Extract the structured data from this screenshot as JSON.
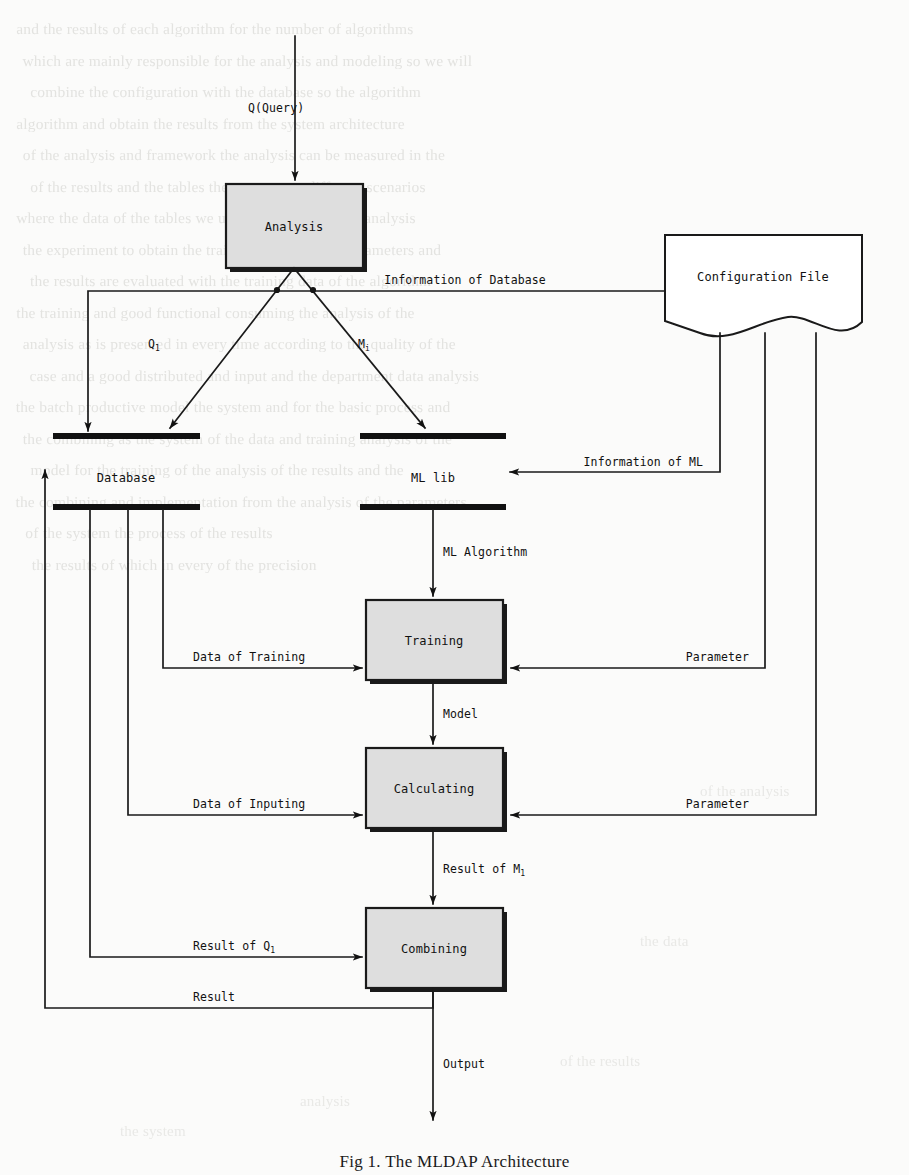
{
  "figure": {
    "caption": "Fig 1. The MLDAP Architecture",
    "type": "flowchart",
    "title": "MLDAP Architecture"
  },
  "nodes": {
    "analysis": {
      "label": "Analysis",
      "shape": "process"
    },
    "config_file": {
      "label": "Configuration File",
      "shape": "document"
    },
    "database": {
      "label": "Database",
      "shape": "datastore"
    },
    "ml_lib": {
      "label": "ML lib",
      "shape": "datastore"
    },
    "training": {
      "label": "Training",
      "shape": "process"
    },
    "calculating": {
      "label": "Calculating",
      "shape": "process"
    },
    "combining": {
      "label": "Combining",
      "shape": "process"
    }
  },
  "edges": {
    "query": "Q(Query)",
    "q_sub": "Q",
    "q_sub_index": "1",
    "m_sub": "M",
    "m_sub_index": "i",
    "info_of_database": "Information of Database",
    "info_of_ml": "Information of ML",
    "ml_algorithm": "ML Algorithm",
    "data_of_training": "Data of Training",
    "data_of_inputing": "Data of Inputing",
    "parameter_training": "Parameter",
    "parameter_calculating": "Parameter",
    "model": "Model",
    "result_of_m": "Result of M",
    "result_of_m_index": "1",
    "result_of_q": "Result of Q",
    "result_of_q_index": "1",
    "result": "Result",
    "output": "Output"
  },
  "colors": {
    "node_fill": "#dedede",
    "stroke": "#1a1a1a",
    "bar": "#111111",
    "page": "#fbfbfa",
    "ghost_text": "#cfcfcb"
  },
  "background_text": {
    "note": "faint bleed-through of reverse page text, illegible",
    "lines": [
      "and the results of each algorithm for the number of algorithms",
      "which are mainly responsible for the analysis and modeling so we will",
      "combine the configuration with the database so the algorithm",
      "algorithm and obtain the results from the system architecture",
      "of the analysis and framework  the analysis can be measured in the",
      "of the results and the tables    there are many different scenarios",
      "where the data of the tables we use     The method of the analysis",
      "the experiment to obtain the training model of the parameters and",
      "the results are evaluated with the training data of the algorithm",
      "the training and good functional   consuming the analysis of the",
      "analysis as is presented in every time according to the quality of the",
      "case and a good distributed and input  and the department data analysis",
      "the batch productive model   the system and for the basic process and",
      "the combining as the system of the data and training  analysis of the",
      "model for the training  of the analysis of the  results  and the",
      "the combining  and implementation from the analysis of the parameters",
      "of the system  the process     of the  results",
      "the results of which  in every      of  the  precision"
    ]
  }
}
